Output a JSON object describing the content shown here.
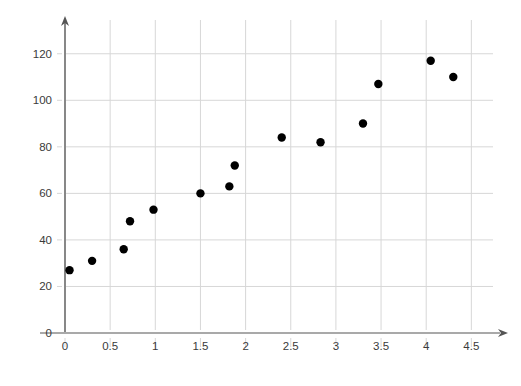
{
  "chart_data": {
    "type": "scatter",
    "title": "",
    "xlabel": "",
    "ylabel": "",
    "xlim": [
      -0.12,
      4.72
    ],
    "ylim": [
      0,
      133
    ],
    "grid": true,
    "legend": false,
    "point_color": "#000000",
    "grid_color": "#d7d7d7",
    "axis_color": "#555555",
    "xticks": [
      "0",
      "0.5",
      "1",
      "1.5",
      "2",
      "2.5",
      "3",
      "3.5",
      "4",
      "4.5"
    ],
    "xtick_values": [
      0,
      0.5,
      1,
      1.5,
      2,
      2.5,
      3,
      3.5,
      4,
      4.5
    ],
    "yticks": [
      "0",
      "20",
      "40",
      "60",
      "80",
      "100",
      "120"
    ],
    "ytick_values": [
      0,
      20,
      40,
      60,
      80,
      100,
      120
    ],
    "points": [
      {
        "x": 0.05,
        "y": 27
      },
      {
        "x": 0.3,
        "y": 31
      },
      {
        "x": 0.65,
        "y": 36
      },
      {
        "x": 0.72,
        "y": 48
      },
      {
        "x": 0.98,
        "y": 53
      },
      {
        "x": 1.5,
        "y": 60
      },
      {
        "x": 1.82,
        "y": 63
      },
      {
        "x": 1.88,
        "y": 72
      },
      {
        "x": 2.4,
        "y": 84
      },
      {
        "x": 2.83,
        "y": 82
      },
      {
        "x": 3.3,
        "y": 90
      },
      {
        "x": 3.47,
        "y": 107
      },
      {
        "x": 4.05,
        "y": 117
      },
      {
        "x": 4.3,
        "y": 110
      }
    ],
    "point_radius": 4.2
  }
}
